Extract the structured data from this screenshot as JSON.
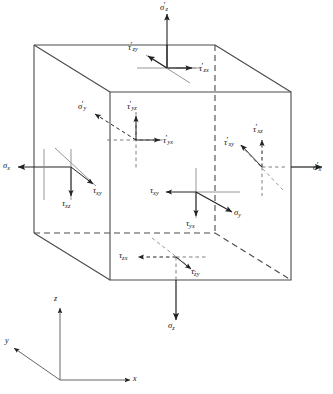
{
  "figure": {
    "type": "stress-element-cube",
    "background_color": "#ffffff",
    "line_color": "#333333",
    "text_color": "#111111"
  },
  "cube": {
    "description": "Oblique-projected cube (parallelepiped) with three visible faces and hidden edges drawn dashed",
    "vertices": {
      "front_top_left": [
        110,
        92
      ],
      "front_top_right": [
        291,
        92
      ],
      "front_bottom_left": [
        110,
        280
      ],
      "front_bottom_right": [
        291,
        280
      ],
      "back_top_left": [
        34,
        45
      ],
      "back_top_right": [
        215,
        45
      ],
      "back_bottom_left": [
        34,
        233
      ],
      "back_bottom_right": [
        215,
        233
      ]
    },
    "hidden_edges": [
      "back_top_right-back_bottom_right",
      "back_bottom_left-back_bottom_right",
      "back_bottom_right-front_bottom_right"
    ]
  },
  "labels": {
    "sigma_z_prime": {
      "base": "σ",
      "sub": "z",
      "prime": "′"
    },
    "tau_zy_prime": {
      "base": "τ",
      "sub": "zy",
      "prime": "′"
    },
    "tau_zx_prime": {
      "base": "τ",
      "sub": "zx",
      "prime": "′"
    },
    "sigma_y_prime": {
      "base": "σ",
      "sub": "y",
      "prime": "′"
    },
    "tau_yz_prime": {
      "base": "τ",
      "sub": "yz",
      "prime": "′"
    },
    "tau_yx_prime": {
      "base": "τ",
      "sub": "yx",
      "prime": "′"
    },
    "tau_xz_prime": {
      "base": "τ",
      "sub": "xz",
      "prime": "′"
    },
    "tau_xy_prime": {
      "base": "τ",
      "sub": "xy",
      "prime": "′"
    },
    "sigma_x_prime": {
      "base": "σ",
      "sub": "x",
      "prime": "′"
    },
    "sigma_x": {
      "base": "σ",
      "sub": "x",
      "prime": ""
    },
    "tau_xy": {
      "base": "τ",
      "sub": "xy",
      "prime": ""
    },
    "tau_xz": {
      "base": "τ",
      "sub": "xz",
      "prime": ""
    },
    "tau_xy_front": {
      "base": "τ",
      "sub": "xy",
      "prime": ""
    },
    "tau_yx": {
      "base": "τ",
      "sub": "yx",
      "prime": ""
    },
    "sigma_y": {
      "base": "σ",
      "sub": "y",
      "prime": ""
    },
    "tau_zx": {
      "base": "τ",
      "sub": "zx",
      "prime": ""
    },
    "tau_zy": {
      "base": "τ",
      "sub": "zy",
      "prime": ""
    },
    "sigma_z": {
      "base": "σ",
      "sub": "z",
      "prime": ""
    }
  },
  "axes": {
    "origin": [
      60,
      380
    ],
    "z": {
      "base": "z",
      "sub": "",
      "prime": "",
      "direction": "up"
    },
    "y": {
      "base": "y",
      "sub": "",
      "prime": "",
      "direction": "lower-left"
    },
    "x": {
      "base": "x",
      "sub": "",
      "prime": "",
      "direction": "right"
    }
  },
  "faces": {
    "top": {
      "name": "top-face",
      "stresses": [
        "sigma_z_prime",
        "tau_zy_prime",
        "tau_zx_prime"
      ]
    },
    "back_left": {
      "name": "back-left-face",
      "stresses": [
        "sigma_y_prime",
        "tau_yz_prime",
        "tau_yx_prime"
      ]
    },
    "right": {
      "name": "right-face",
      "stresses": [
        "sigma_x_prime",
        "tau_xz_prime",
        "tau_xy_prime"
      ]
    },
    "left": {
      "name": "left-face",
      "stresses": [
        "sigma_x",
        "tau_xy",
        "tau_xz"
      ]
    },
    "front": {
      "name": "front-face",
      "stresses": [
        "sigma_y",
        "tau_xy_front",
        "tau_yx"
      ]
    },
    "bottom": {
      "name": "bottom-face",
      "stresses": [
        "sigma_z",
        "tau_zx",
        "tau_zy"
      ]
    }
  }
}
